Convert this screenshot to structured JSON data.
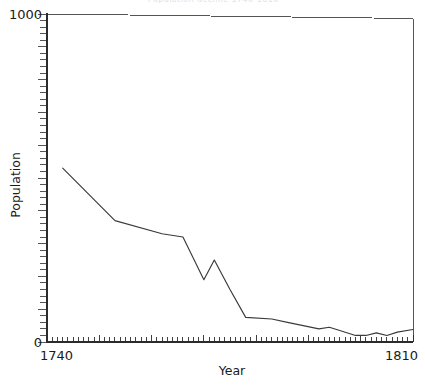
{
  "header": {
    "clipped_title": "Population decline 1740-1810"
  },
  "chart_data": {
    "type": "line",
    "title": "",
    "xlabel": "Year",
    "ylabel": "Population",
    "xlim": [
      1740,
      1810
    ],
    "ylim": [
      0,
      1000
    ],
    "x_tick_labels": [
      "1740",
      "1810"
    ],
    "y_tick_labels": [
      "0",
      "1000"
    ],
    "x_minor_tick_step": 1,
    "y_minor_tick_step": 20,
    "grid": false,
    "legend": "none",
    "series": [
      {
        "name": "Population",
        "x": [
          1743,
          1753,
          1762,
          1766,
          1770,
          1772,
          1775,
          1778,
          1783,
          1786,
          1789,
          1792,
          1794,
          1796,
          1799,
          1801,
          1803,
          1805,
          1807,
          1810
        ],
        "values": [
          530,
          370,
          330,
          320,
          190,
          250,
          160,
          75,
          70,
          60,
          50,
          40,
          45,
          35,
          20,
          20,
          28,
          20,
          30,
          38
        ]
      }
    ]
  },
  "axes": {
    "y_max_label": "1000",
    "y_min_label": "0",
    "x_min_label": "1740",
    "x_max_label": "1810"
  }
}
